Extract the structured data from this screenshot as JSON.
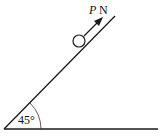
{
  "diagram": {
    "force_label_variable": "P",
    "force_label_unit": "N",
    "angle_label": "45°",
    "stroke_color": "#1a1a1a",
    "background": "#ffffff"
  }
}
